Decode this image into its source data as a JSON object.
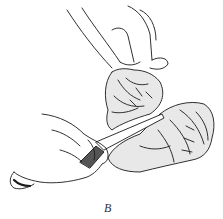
{
  "figure": {
    "caption": "B",
    "ink_color": "#1a1a1a",
    "background": "#ffffff"
  }
}
